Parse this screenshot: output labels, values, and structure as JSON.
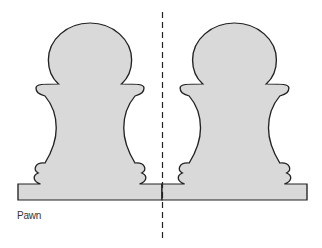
{
  "figure": {
    "caption": "Pawn",
    "fill_color": "#d9d9d9",
    "stroke_color": "#222222",
    "axis_style": "dashed vertical line of symmetry",
    "pieces": [
      {
        "name": "left-pawn",
        "type": "pawn"
      },
      {
        "name": "right-pawn",
        "type": "pawn"
      }
    ]
  }
}
